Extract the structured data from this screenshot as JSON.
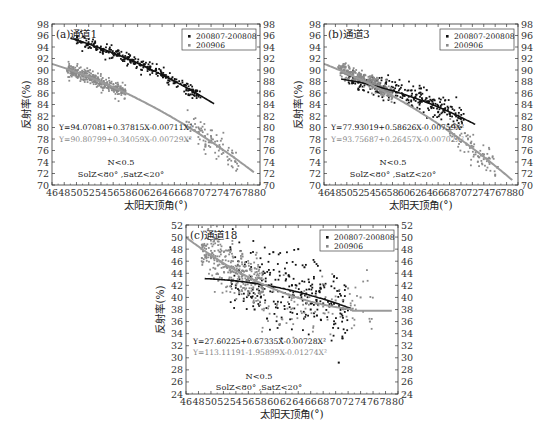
{
  "chart_data": [
    {
      "id": "a",
      "type": "scatter",
      "title": "(a)通道1",
      "xlabel": "太阳天顶角(°)",
      "ylabel": "反射率(%)",
      "xlim": [
        46,
        80
      ],
      "ylim": [
        70,
        98
      ],
      "xticks": [
        46,
        48,
        50,
        52,
        54,
        56,
        58,
        60,
        62,
        64,
        66,
        68,
        70,
        72,
        74,
        76,
        78,
        80
      ],
      "yticks": [
        70,
        72,
        74,
        76,
        78,
        80,
        82,
        84,
        86,
        88,
        90,
        92,
        94,
        96,
        98
      ],
      "grid": false,
      "legend": {
        "position": "upper right",
        "entries": [
          "200807-200808",
          "200906"
        ]
      },
      "series": [
        {
          "name": "200807-200808",
          "color": "#111111",
          "marker": "square",
          "fit": {
            "a": 94.07081,
            "b": 0.37815,
            "c": -0.00711,
            "x_range": [
              49,
              72.5
            ]
          },
          "points_desc": "dense band following fit from x≈50 (y≈95.5) to x≈70 (y≈85)",
          "x": [
            50,
            51,
            52,
            53,
            54,
            55,
            56,
            57,
            58,
            59,
            60,
            61,
            62,
            63,
            64,
            65,
            66,
            67,
            68,
            69,
            70
          ],
          "y": [
            95.2,
            94.8,
            94.5,
            94.0,
            93.6,
            93.2,
            92.8,
            92.5,
            92.0,
            91.6,
            91.4,
            91.0,
            90.6,
            90.2,
            89.0,
            88.8,
            88.0,
            87.6,
            86.6,
            86.6,
            85.6
          ]
        },
        {
          "name": "200906",
          "color": "#8a8a8a",
          "marker": "square",
          "fit": {
            "a": 90.80799,
            "b": 0.34059,
            "c": -0.00729,
            "x_range": [
              46,
              79
            ]
          },
          "points_desc": "dense cluster x≈48-58 y≈86-90, sparse points x≈68-77 y≈74-81",
          "x": [
            48.5,
            49,
            50,
            51,
            52,
            53,
            54,
            55,
            56,
            57,
            58,
            68,
            69,
            70,
            71,
            72,
            73,
            74,
            75,
            76
          ],
          "y": [
            90,
            89.8,
            89.4,
            89,
            88.6,
            88.2,
            87.8,
            87.4,
            87,
            86.6,
            86.3,
            81,
            80.2,
            79.2,
            78.5,
            77.5,
            76.8,
            75.6,
            74.5,
            74
          ]
        }
      ],
      "annotations": [
        {
          "text": "Y=94.07081+0.37815X-0.00711X²",
          "color": "#111111"
        },
        {
          "text": "Y=90.80799+0.34059X-0.00729X²",
          "color": "#888888"
        },
        {
          "text": "N<0.5"
        },
        {
          "text": "SolZ<80° ,SatZ<20°"
        }
      ]
    },
    {
      "id": "b",
      "type": "scatter",
      "title": "(b)通道3",
      "xlabel": "太阳天顶角(°)",
      "ylabel": "反射率(%)",
      "xlim": [
        46,
        80
      ],
      "ylim": [
        70,
        98
      ],
      "xticks": [
        46,
        48,
        50,
        52,
        54,
        56,
        58,
        60,
        62,
        64,
        66,
        68,
        70,
        72,
        74,
        76,
        78,
        80
      ],
      "yticks": [
        70,
        72,
        74,
        76,
        78,
        80,
        82,
        84,
        86,
        88,
        90,
        92,
        94,
        96,
        98
      ],
      "grid": false,
      "legend": {
        "position": "upper right",
        "entries": [
          "200807-200808",
          "200906"
        ]
      },
      "series": [
        {
          "name": "200807-200808",
          "color": "#111111",
          "marker": "square",
          "fit": {
            "a": 77.93019,
            "b": 0.58626,
            "c": -0.00759,
            "x_range": [
              49,
              72.5
            ]
          },
          "points_desc": "scattered band x≈52-70 y≈82-87.5, with cluster x≈63-68 y≈85-87",
          "x": [
            52,
            54,
            56,
            58,
            60,
            62,
            63,
            64,
            65,
            66,
            67,
            68,
            69,
            70
          ],
          "y": [
            87.8,
            87.4,
            86.5,
            86.2,
            85.6,
            85.2,
            86.8,
            86.5,
            84.5,
            83.8,
            83.2,
            82.4,
            82.2,
            81.5
          ]
        },
        {
          "name": "200906",
          "color": "#8a8a8a",
          "marker": "square",
          "fit": {
            "a": 93.75687,
            "b": 0.26457,
            "c": -0.00702,
            "x_range": [
              46,
              79
            ]
          },
          "points_desc": "dense cluster x≈48-56 y≈86-91, sparse points x≈68-76 y≈71-80",
          "x": [
            48.5,
            49,
            50,
            51,
            52,
            53,
            54,
            55,
            56,
            68,
            69,
            70,
            71,
            72,
            73,
            74,
            75,
            76
          ],
          "y": [
            90.5,
            90,
            89.5,
            89,
            88.5,
            88,
            87.5,
            87,
            86.5,
            80,
            78.5,
            77.5,
            77,
            76.5,
            75,
            74.5,
            74,
            71.8
          ]
        }
      ],
      "annotations": [
        {
          "text": "Y=77.93019+0.58626X-0.00759X²",
          "color": "#111111"
        },
        {
          "text": "Y=93.75687+0.26457X-0.00702X²",
          "color": "#888888"
        },
        {
          "text": "N<0.5"
        },
        {
          "text": "SolZ<80° ,SatZ<20°"
        }
      ]
    },
    {
      "id": "c",
      "type": "scatter",
      "title": "(c)通道18",
      "xlabel": "太阳天顶角(°)",
      "ylabel": "反射率(%)",
      "xlim": [
        46,
        80
      ],
      "ylim": [
        24,
        52
      ],
      "xticks": [
        46,
        48,
        50,
        52,
        54,
        56,
        58,
        60,
        62,
        64,
        66,
        68,
        70,
        72,
        74,
        76,
        78,
        80
      ],
      "yticks": [
        24,
        26,
        28,
        30,
        32,
        34,
        36,
        38,
        40,
        42,
        44,
        46,
        48,
        50,
        52
      ],
      "grid": false,
      "legend": {
        "position": "upper right",
        "entries": [
          "200807-200808",
          "200906"
        ]
      },
      "series": [
        {
          "name": "200807-200808",
          "color": "#111111",
          "marker": "square",
          "fit": {
            "a": 27.60225,
            "b": 0.67335,
            "c": -0.00728,
            "x_range": [
              49,
              72.5
            ]
          },
          "points_desc": "widely scattered x≈54-72 y≈34-49; outlier at x≈70.5 y≈29",
          "x": [
            54,
            56,
            57,
            58,
            59,
            60,
            61,
            62,
            63,
            64,
            65,
            66,
            67,
            68,
            69,
            70.5
          ],
          "y": [
            42,
            41,
            38,
            40,
            36.5,
            47.5,
            35.5,
            44,
            42,
            48,
            45,
            38,
            37,
            39,
            38.5,
            29.2
          ]
        },
        {
          "name": "200906",
          "color": "#8a8a8a",
          "marker": "square",
          "fit": {
            "a": 113.11191,
            "b": -1.95899,
            "c": 0.01274,
            "x_range": [
              46,
              79
            ]
          },
          "points_desc": "dense cluster x≈48-58 y≈40-50, sparse x≈58-76 y≈35-43",
          "x": [
            48.5,
            49,
            50,
            51,
            52,
            53,
            54,
            55,
            56,
            57,
            58,
            60,
            64,
            68,
            70,
            72,
            74,
            75.5
          ],
          "y": [
            48,
            47,
            46.5,
            46,
            45,
            44.5,
            44,
            43.5,
            43,
            42.5,
            42,
            41,
            40,
            38.5,
            39.5,
            41.5,
            40,
            36
          ]
        }
      ],
      "annotations": [
        {
          "text": "Y=27.60225+0.67335X-0.00728X²",
          "color": "#111111"
        },
        {
          "text": "Y=113.11191-1.95899X-0.01274X²",
          "color": "#888888"
        },
        {
          "text": "N<0.5"
        },
        {
          "text": "SolZ<80° ,SatZ<20°"
        }
      ]
    }
  ],
  "layout": {
    "panels": [
      {
        "id": "a",
        "left": 52,
        "top": 24,
        "right": 260,
        "bottom": 185
      },
      {
        "id": "b",
        "left": 324,
        "top": 24,
        "right": 518,
        "bottom": 185
      },
      {
        "id": "c",
        "left": 186,
        "top": 225,
        "right": 398,
        "bottom": 394
      }
    ]
  }
}
